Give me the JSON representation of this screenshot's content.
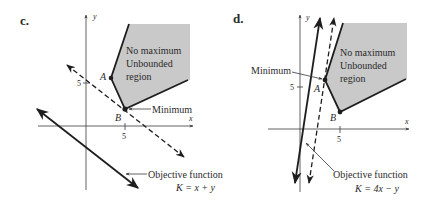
{
  "colors": {
    "ink": "#1e1e1e",
    "axis": "#3a3a3a",
    "region_fill": "#c9c9c9",
    "background": "#ffffff"
  },
  "panels": [
    {
      "id": "c",
      "label": "c.",
      "axis_x_label": "x",
      "axis_y_label": "y",
      "x_tick": "5",
      "y_tick": "5",
      "region_text": [
        "No maximum",
        "Unbounded",
        "region"
      ],
      "point_a": "A",
      "point_b": "B",
      "callout": "Minimum",
      "objective_label": "Objective function",
      "objective_formula": "K = x + y"
    },
    {
      "id": "d",
      "label": "d.",
      "axis_x_label": "x",
      "axis_y_label": "y",
      "x_tick": "5",
      "y_tick": "5",
      "region_text": [
        "No maximum",
        "Unbounded",
        "region"
      ],
      "point_a": "A",
      "point_b": "B",
      "callout": "Minimum",
      "objective_label": "Objective function",
      "objective_formula": "K = 4x − y"
    }
  ]
}
